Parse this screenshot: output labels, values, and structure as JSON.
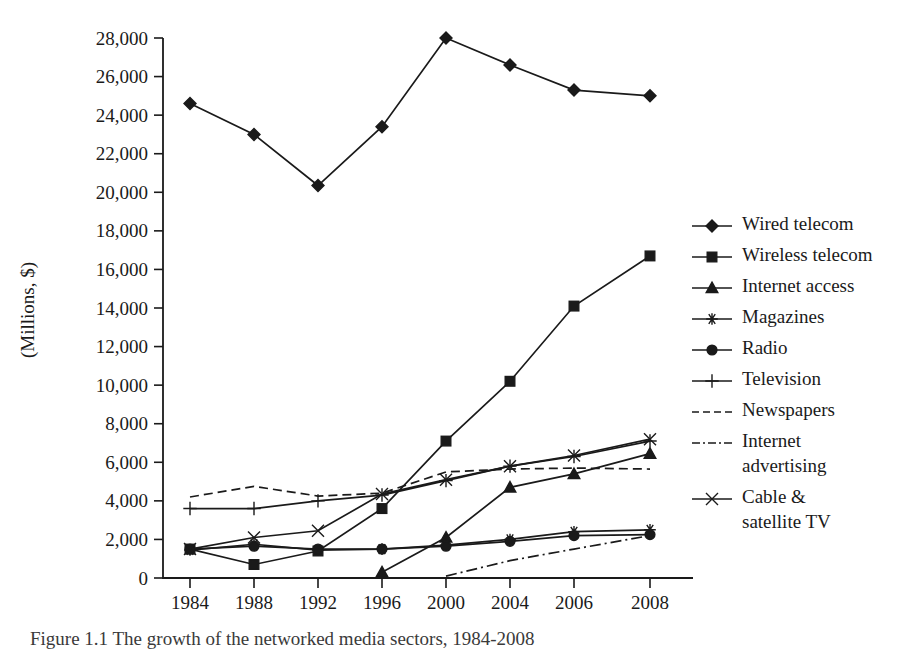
{
  "figure": {
    "caption": "Figure 1.1 The growth of the networked media sectors, 1984-2008",
    "caption_visible_note": "clipped at bottom edge"
  },
  "chart_data": {
    "type": "line",
    "title": "",
    "xlabel": "",
    "ylabel": "(Millions, $)",
    "ylim": [
      0,
      28000
    ],
    "y_ticks": [
      0,
      2000,
      4000,
      6000,
      8000,
      10000,
      12000,
      14000,
      16000,
      18000,
      20000,
      22000,
      24000,
      26000,
      28000
    ],
    "y_tick_labels": [
      "0",
      "2,000",
      "4,000",
      "6,000",
      "8,000",
      "10,000",
      "12,000",
      "14,000",
      "16,000",
      "18,000",
      "20,000",
      "22,000",
      "24,000",
      "26,000",
      "28,000"
    ],
    "categories": [
      "1984",
      "1988",
      "1992",
      "1996",
      "2000",
      "2004",
      "2006",
      "2008"
    ],
    "x_tick_labels": [
      "1984",
      "1988",
      "1992",
      "1996",
      "2000",
      "2004",
      "2006",
      "2008"
    ],
    "grid": false,
    "legend_position": "right",
    "series": [
      {
        "name": "Wired telecom",
        "marker": "diamond",
        "linestyle": "solid",
        "values": [
          24600,
          23000,
          20350,
          23400,
          28000,
          26600,
          25300,
          25000
        ]
      },
      {
        "name": "Wireless telecom",
        "marker": "square",
        "linestyle": "solid",
        "values": [
          1500,
          700,
          1400,
          3600,
          7100,
          10200,
          14100,
          16700
        ]
      },
      {
        "name": "Internet access",
        "marker": "triangle",
        "linestyle": "solid",
        "values": [
          null,
          null,
          null,
          300,
          2100,
          4700,
          5400,
          6450
        ]
      },
      {
        "name": "Magazines",
        "marker": "asterisk",
        "linestyle": "solid",
        "values": [
          1450,
          1750,
          1450,
          1500,
          1700,
          2000,
          2400,
          2500
        ]
      },
      {
        "name": "Radio",
        "marker": "circle",
        "linestyle": "solid",
        "values": [
          1500,
          1650,
          1500,
          1500,
          1650,
          1900,
          2200,
          2250
        ]
      },
      {
        "name": "Television",
        "marker": "plus",
        "linestyle": "solid",
        "values": [
          3600,
          3600,
          4000,
          4300,
          5050,
          5800,
          6300,
          7100
        ]
      },
      {
        "name": "Newspapers",
        "marker": "none",
        "linestyle": "dashed",
        "values": [
          4200,
          4750,
          4250,
          4400,
          5500,
          5650,
          5700,
          5650
        ]
      },
      {
        "name": "Internet advertising",
        "marker": "none",
        "linestyle": "dashdot",
        "values": [
          null,
          null,
          null,
          null,
          100,
          900,
          1500,
          2200
        ]
      },
      {
        "name": "Cable & satellite TV",
        "marker": "cross",
        "linestyle": "solid",
        "values": [
          1500,
          2100,
          2450,
          4350,
          5100,
          5800,
          6350,
          7200
        ]
      }
    ]
  },
  "legend": {
    "entries": [
      {
        "label": "Wired telecom",
        "marker": "diamond",
        "linestyle": "solid"
      },
      {
        "label": "Wireless telecom",
        "marker": "square",
        "linestyle": "solid"
      },
      {
        "label": "Internet access",
        "marker": "triangle",
        "linestyle": "solid"
      },
      {
        "label": "Magazines",
        "marker": "asterisk",
        "linestyle": "solid"
      },
      {
        "label": "Radio",
        "marker": "circle",
        "linestyle": "solid"
      },
      {
        "label": "Television",
        "marker": "plus",
        "linestyle": "solid"
      },
      {
        "label": "Newspapers",
        "marker": "none",
        "linestyle": "dashed"
      },
      {
        "label": "Internet advertising",
        "marker": "none",
        "linestyle": "dashdot",
        "label_lines": [
          "Internet",
          "advertising"
        ]
      },
      {
        "label": "Cable & satellite TV",
        "marker": "cross",
        "linestyle": "solid",
        "label_lines": [
          "Cable &",
          "satellite TV"
        ]
      }
    ]
  },
  "colors": {
    "ink": "#1a1a1a",
    "background": "#ffffff"
  }
}
